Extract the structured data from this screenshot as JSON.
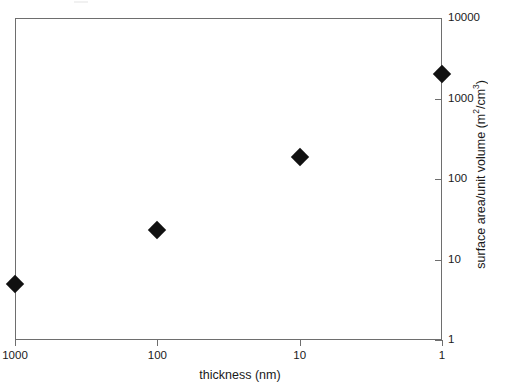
{
  "chart_data": {
    "type": "scatter",
    "title": "",
    "xlabel": "thickness (nm)",
    "ylabel": "surface area/unit volume (m²/cm³)",
    "ylabel_parts": {
      "prefix": "surface area/unit volume (m",
      "sup1": "2",
      "middle": "/cm",
      "sup2": "3",
      "suffix": ")"
    },
    "xscale": "log",
    "yscale": "log",
    "x_reversed": true,
    "xlim": [
      1000,
      1
    ],
    "ylim": [
      1,
      10000
    ],
    "grid": false,
    "legend": null,
    "x_ticks": [
      {
        "value": 1000,
        "label": "1000"
      },
      {
        "value": 100,
        "label": "100"
      },
      {
        "value": 10,
        "label": "10"
      },
      {
        "value": 1,
        "label": "1"
      }
    ],
    "y_ticks": [
      {
        "value": 10000,
        "label": "10000"
      },
      {
        "value": 1000,
        "label": "1000"
      },
      {
        "value": 100,
        "label": "100"
      },
      {
        "value": 10,
        "label": "10"
      },
      {
        "value": 1,
        "label": "1"
      }
    ],
    "series": [
      {
        "name": "surface area/unit volume",
        "marker": "diamond",
        "color": "#111111",
        "points": [
          {
            "x": 1000,
            "y": 5
          },
          {
            "x": 100,
            "y": 23
          },
          {
            "x": 10,
            "y": 190
          },
          {
            "x": 1,
            "y": 2000
          }
        ]
      }
    ]
  },
  "axis_color": "#6e6e6e",
  "marker_color": "#111111",
  "background_color": "#ffffff"
}
